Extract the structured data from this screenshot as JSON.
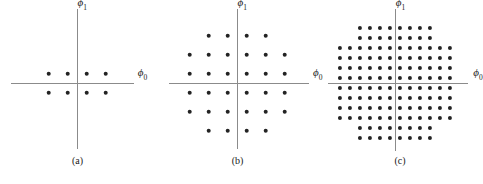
{
  "figure": {
    "title": "",
    "background_color": "#ffffff",
    "dot_color": "#232323",
    "axis_color": "#8b8b8b",
    "text_color": "#1a1a1a",
    "width": 480,
    "height": 184
  },
  "axis_labels": {
    "x": "ϕ",
    "x_sub": "0",
    "y": "ϕ",
    "y_sub": "1"
  },
  "panels": [
    {
      "id": "a",
      "caption": "(a)",
      "left": 0,
      "width": 155,
      "origin_x": 77,
      "origin_y": 83,
      "unit": 9.5,
      "dot_size": 4.6,
      "axis_x_from": -7.0,
      "axis_x_to": 6.0,
      "axis_y_from": -7.0,
      "axis_y_to": 7.8,
      "x_label_x": 6.9,
      "x_label_y": 0.95,
      "y_label_x": 0.55,
      "y_label_y": 8.3,
      "num_points": 8,
      "rows": [
        {
          "y": 1,
          "x": [
            -3,
            -1,
            1,
            3
          ]
        },
        {
          "y": -1,
          "x": [
            -3,
            -1,
            1,
            3
          ]
        }
      ]
    },
    {
      "id": "b",
      "caption": "(b)",
      "left": 155,
      "width": 165,
      "origin_x": 82,
      "origin_y": 83,
      "unit": 9.5,
      "dot_size": 4.6,
      "axis_x_from": -7.2,
      "axis_x_to": 7.6,
      "axis_y_from": -7.0,
      "axis_y_to": 7.8,
      "x_label_x": 8.5,
      "x_label_y": 0.95,
      "y_label_x": 0.55,
      "y_label_y": 8.3,
      "num_points": 32,
      "rows": [
        {
          "y": 5,
          "x": [
            -3,
            -1,
            1,
            3
          ]
        },
        {
          "y": 3,
          "x": [
            -5,
            -3,
            -1,
            1,
            3,
            5
          ]
        },
        {
          "y": 1,
          "x": [
            -5,
            -3,
            -1,
            1,
            3,
            5
          ]
        },
        {
          "y": -1,
          "x": [
            -5,
            -3,
            -1,
            1,
            3,
            5
          ]
        },
        {
          "y": -3,
          "x": [
            -5,
            -3,
            -1,
            1,
            3,
            5
          ]
        },
        {
          "y": -5,
          "x": [
            -3,
            -1,
            1,
            3
          ]
        }
      ]
    },
    {
      "id": "c",
      "caption": "(c)",
      "left": 320,
      "width": 160,
      "origin_x": 75,
      "origin_y": 83,
      "unit": 5.0,
      "dot_size": 4.2,
      "axis_x_from": -13.5,
      "axis_x_to": 14.5,
      "axis_y_from": -13.5,
      "axis_y_to": 14.8,
      "x_label_x": 16.6,
      "x_label_y": 1.8,
      "y_label_x": 1.1,
      "y_label_y": 15.8,
      "num_points": 128,
      "rows": [
        {
          "y": 11,
          "x": [
            -7,
            -5,
            -3,
            -1,
            1,
            3,
            5,
            7
          ]
        },
        {
          "y": 9,
          "x": [
            -7,
            -5,
            -3,
            -1,
            1,
            3,
            5,
            7
          ]
        },
        {
          "y": 7,
          "x": [
            -11,
            -9,
            -7,
            -5,
            -3,
            -1,
            1,
            3,
            5,
            7,
            9,
            11
          ]
        },
        {
          "y": 5,
          "x": [
            -11,
            -9,
            -7,
            -5,
            -3,
            -1,
            1,
            3,
            5,
            7,
            9,
            11
          ]
        },
        {
          "y": 3,
          "x": [
            -11,
            -9,
            -7,
            -5,
            -3,
            -1,
            1,
            3,
            5,
            7,
            9,
            11
          ]
        },
        {
          "y": 1,
          "x": [
            -11,
            -9,
            -7,
            -5,
            -3,
            -1,
            1,
            3,
            5,
            7,
            9,
            11
          ]
        },
        {
          "y": -1,
          "x": [
            -11,
            -9,
            -7,
            -5,
            -3,
            -1,
            1,
            3,
            5,
            7,
            9,
            11
          ]
        },
        {
          "y": -3,
          "x": [
            -11,
            -9,
            -7,
            -5,
            -3,
            -1,
            1,
            3,
            5,
            7,
            9,
            11
          ]
        },
        {
          "y": -5,
          "x": [
            -11,
            -9,
            -7,
            -5,
            -3,
            -1,
            1,
            3,
            5,
            7,
            9,
            11
          ]
        },
        {
          "y": -7,
          "x": [
            -11,
            -9,
            -7,
            -5,
            -3,
            -1,
            1,
            3,
            5,
            7,
            9,
            11
          ]
        },
        {
          "y": -9,
          "x": [
            -7,
            -5,
            -3,
            -1,
            1,
            3,
            5,
            7
          ]
        },
        {
          "y": -11,
          "x": [
            -7,
            -5,
            -3,
            -1,
            1,
            3,
            5,
            7
          ]
        }
      ]
    }
  ],
  "chart_data": {
    "type": "scatter",
    "title": "",
    "xlabel": "ϕ0",
    "ylabel": "ϕ1",
    "grid": false,
    "legend": "none",
    "subplots": [
      {
        "label": "(a)",
        "name": "8-point cross constellation",
        "n_points": 8,
        "xlim": [
          -7,
          6
        ],
        "ylim": [
          -7,
          7.8
        ],
        "points": [
          [
            -3,
            1
          ],
          [
            -1,
            1
          ],
          [
            1,
            1
          ],
          [
            3,
            1
          ],
          [
            -3,
            -1
          ],
          [
            -1,
            -1
          ],
          [
            1,
            -1
          ],
          [
            3,
            -1
          ]
        ]
      },
      {
        "label": "(b)",
        "name": "32-point cross constellation",
        "n_points": 32,
        "xlim": [
          -7.2,
          7.6
        ],
        "ylim": [
          -7,
          7.8
        ],
        "points": [
          [
            -3,
            5
          ],
          [
            -1,
            5
          ],
          [
            1,
            5
          ],
          [
            3,
            5
          ],
          [
            -5,
            3
          ],
          [
            -3,
            3
          ],
          [
            -1,
            3
          ],
          [
            1,
            3
          ],
          [
            3,
            3
          ],
          [
            5,
            3
          ],
          [
            -5,
            1
          ],
          [
            -3,
            1
          ],
          [
            -1,
            1
          ],
          [
            1,
            1
          ],
          [
            3,
            1
          ],
          [
            5,
            1
          ],
          [
            -5,
            -1
          ],
          [
            -3,
            -1
          ],
          [
            -1,
            -1
          ],
          [
            1,
            -1
          ],
          [
            3,
            -1
          ],
          [
            5,
            -1
          ],
          [
            -5,
            -3
          ],
          [
            -3,
            -3
          ],
          [
            -1,
            -3
          ],
          [
            1,
            -3
          ],
          [
            3,
            -3
          ],
          [
            5,
            -3
          ],
          [
            -3,
            -5
          ],
          [
            -1,
            -5
          ],
          [
            1,
            -5
          ],
          [
            3,
            -5
          ]
        ]
      },
      {
        "label": "(c)",
        "name": "128-point cross constellation",
        "n_points": 128,
        "xlim": [
          -13.5,
          14.5
        ],
        "ylim": [
          -13.5,
          14.8
        ],
        "row_counts": [
          8,
          8,
          12,
          12,
          12,
          12,
          12,
          12,
          12,
          12,
          8,
          8
        ],
        "row_y": [
          11,
          9,
          7,
          5,
          3,
          1,
          -1,
          -3,
          -5,
          -7,
          -9,
          -11
        ],
        "narrow_row_x": [
          -7,
          -5,
          -3,
          -1,
          1,
          3,
          5,
          7
        ],
        "wide_row_x": [
          -11,
          -9,
          -7,
          -5,
          -3,
          -1,
          1,
          3,
          5,
          7,
          9,
          11
        ]
      }
    ]
  }
}
